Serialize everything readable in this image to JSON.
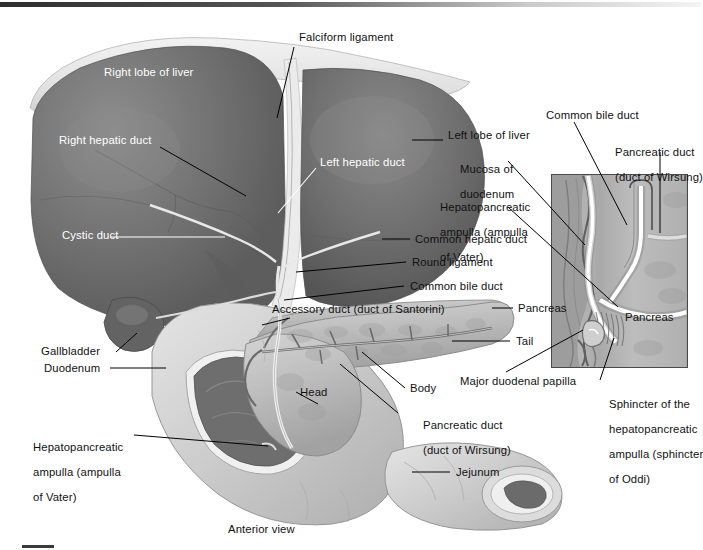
{
  "figure": {
    "view_caption": "Anterior view",
    "accent_color": "#111111",
    "liver_color": "#6f6f6f",
    "liver_light_color": "#9a9a9a",
    "duodenum_color": "#cfcfcf",
    "pancreas_color": "#bdbdbd",
    "inset_bg_color": "#b9b9b9",
    "background_color": "#ffffff"
  },
  "labels": {
    "falciform_ligament": "Falciform ligament",
    "right_lobe_of_liver": "Right lobe of liver",
    "right_hepatic_duct": "Right hepatic duct",
    "left_hepatic_duct": "Left hepatic duct",
    "cystic_duct": "Cystic duct",
    "left_lobe_of_liver": "Left lobe of liver",
    "mucosa_of_duodenum_l1": "Mucosa of",
    "mucosa_of_duodenum_l2": "duodenum",
    "hepatopancreatic_ampulla_r_l1": "Hepatopancreatic",
    "hepatopancreatic_ampulla_r_l2": "ampulla (ampulla",
    "hepatopancreatic_ampulla_r_l3": "of Vater)",
    "common_hepatic_duct": "Common hepatic duct",
    "round_ligament": "Round ligament",
    "common_bile_duct_left": "Common bile duct",
    "accessory_duct": "Accessory duct (duct of Santorini)",
    "pancreas_left": "Pancreas",
    "tail": "Tail",
    "body": "Body",
    "head": "Head",
    "pancreatic_duct_left_l1": "Pancreatic duct",
    "pancreatic_duct_left_l2": "(duct of Wirsung)",
    "jejunum": "Jejunum",
    "gallbladder": "Gallbladder",
    "duodenum": "Duodenum",
    "hepatopancreatic_ampulla_bl_l1": "Hepatopancreatic",
    "hepatopancreatic_ampulla_bl_l2": "ampulla (ampulla",
    "hepatopancreatic_ampulla_bl_l3": "of Vater)",
    "anterior_view": "Anterior view",
    "common_bile_duct_inset": "Common bile duct",
    "pancreatic_duct_inset_l1": "Pancreatic duct",
    "pancreatic_duct_inset_l2": "(duct of Wirsung)",
    "pancreas_inset": "Pancreas",
    "major_duodenal_papilla": "Major duodenal papilla",
    "sphincter_l1": "Sphincter of the",
    "sphincter_l2": "hepatopancreatic",
    "sphincter_l3": "ampulla (sphincter",
    "sphincter_l4": "of Oddi)"
  }
}
